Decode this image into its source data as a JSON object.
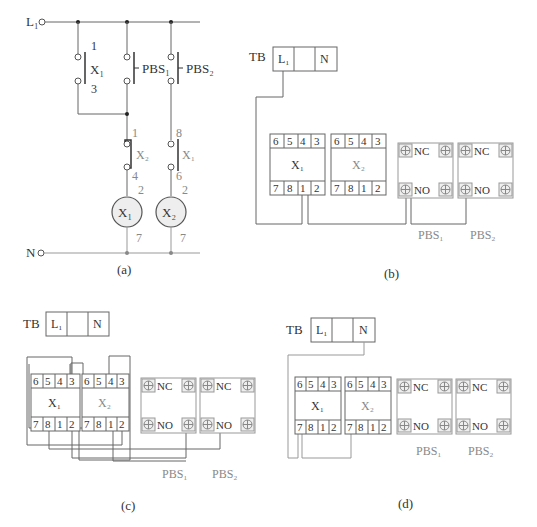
{
  "panels": {
    "a": {
      "caption": "(a)",
      "rails": {
        "line": "L₁",
        "neutral": "N"
      },
      "contacts": [
        {
          "name": "X₁",
          "top_terminal": "1",
          "bottom_terminal": "3",
          "type": "NO auxiliary contact (self-hold)"
        },
        {
          "name": "PBS₁",
          "type": "NO push button"
        },
        {
          "name": "PBS₂",
          "type": "NO push button"
        },
        {
          "name": "X₂",
          "top_terminal": "1",
          "bottom_terminal": "4",
          "type": "NC interlock contact"
        },
        {
          "name": "X₁",
          "top_terminal": "8",
          "bottom_terminal": "6",
          "type": "NO contact"
        }
      ],
      "coils": [
        {
          "name": "X₁",
          "top_terminal": "2",
          "bottom_terminal": "7"
        },
        {
          "name": "X₂",
          "top_terminal": "2",
          "bottom_terminal": "7"
        }
      ]
    },
    "b": {
      "caption": "(b)",
      "terminal_block": {
        "label": "TB",
        "cells": [
          "L₁",
          "",
          "N"
        ]
      },
      "relays": [
        {
          "name": "X₁",
          "top_pins": [
            "6",
            "5",
            "4",
            "3"
          ],
          "bottom_pins": [
            "7",
            "8",
            "1",
            "2"
          ]
        },
        {
          "name": "X₂",
          "top_pins": [
            "6",
            "5",
            "4",
            "3"
          ],
          "bottom_pins": [
            "7",
            "8",
            "1",
            "2"
          ]
        }
      ],
      "push_buttons": [
        {
          "name": "PBS₁",
          "top": "NC",
          "bottom": "NO"
        },
        {
          "name": "PBS₂",
          "top": "NC",
          "bottom": "NO"
        }
      ]
    },
    "c": {
      "caption": "(c)",
      "terminal_block": {
        "label": "TB",
        "cells": [
          "L₁",
          "",
          "N"
        ]
      },
      "relays": [
        {
          "name": "X₁",
          "top_pins": [
            "6",
            "5",
            "4",
            "3"
          ],
          "bottom_pins": [
            "7",
            "8",
            "1",
            "2"
          ]
        },
        {
          "name": "X₂",
          "top_pins": [
            "6",
            "5",
            "4",
            "3"
          ],
          "bottom_pins": [
            "7",
            "8",
            "1",
            "2"
          ]
        }
      ],
      "push_buttons": [
        {
          "name": "PBS₁",
          "top": "NC",
          "bottom": "NO"
        },
        {
          "name": "PBS₂",
          "top": "NC",
          "bottom": "NO"
        }
      ]
    },
    "d": {
      "caption": "(d)",
      "terminal_block": {
        "label": "TB",
        "cells": [
          "L₁",
          "",
          "N"
        ]
      },
      "relays": [
        {
          "name": "X₁",
          "top_pins": [
            "6",
            "5",
            "4",
            "3"
          ],
          "bottom_pins": [
            "7",
            "8",
            "1",
            "2"
          ]
        },
        {
          "name": "X₂",
          "top_pins": [
            "6",
            "5",
            "4",
            "3"
          ],
          "bottom_pins": [
            "7",
            "8",
            "1",
            "2"
          ]
        }
      ],
      "push_buttons": [
        {
          "name": "PBS₁",
          "top": "NC",
          "bottom": "NO"
        },
        {
          "name": "PBS₂",
          "top": "NC",
          "bottom": "NO"
        }
      ]
    }
  },
  "colors": {
    "wire": "#666666",
    "wire_light": "#999999",
    "coil_fill": "#eeeeee",
    "text": "#333333"
  }
}
